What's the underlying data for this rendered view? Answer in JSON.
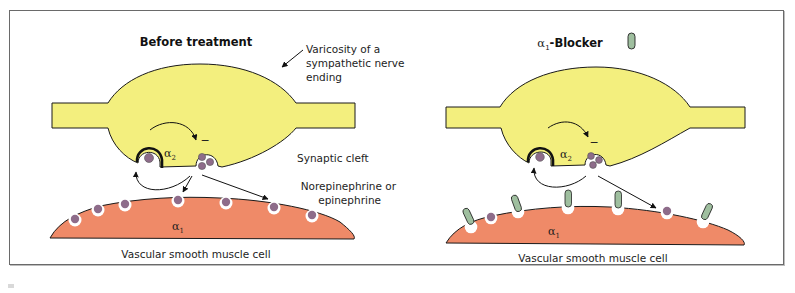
{
  "panels": [
    {
      "title": "Before treatment",
      "labels": {
        "varicosity_line1": "Varicosity of a",
        "varicosity_line2": "sympathetic nerve",
        "varicosity_line3": "ending",
        "synaptic_cleft": "Synaptic cleft",
        "transmitter_line1": "Norepinephrine or",
        "transmitter_line2": "epinephrine",
        "alpha2": "α",
        "alpha2_sub": "2",
        "alpha1": "α",
        "alpha1_sub": "1",
        "inhibition_mark": "−",
        "cell": "Vascular smooth muscle cell"
      }
    },
    {
      "title_prefix": "α",
      "title_sub": "1",
      "title_suffix": "-Blocker",
      "labels": {
        "alpha2": "α",
        "alpha2_sub": "2",
        "alpha1": "α",
        "alpha1_sub": "1",
        "inhibition_mark": "−",
        "cell": "Vascular smooth muscle cell"
      }
    }
  ],
  "colors": {
    "nerve_ending": "#f3ef7e",
    "muscle_cell": "#ef8a68",
    "vesicle": "#8e6c8a",
    "blocker": "#9fbf9f",
    "outline": "#1a1a1a"
  },
  "legend": {
    "blocker_icon": "green-rounded-capsule"
  }
}
